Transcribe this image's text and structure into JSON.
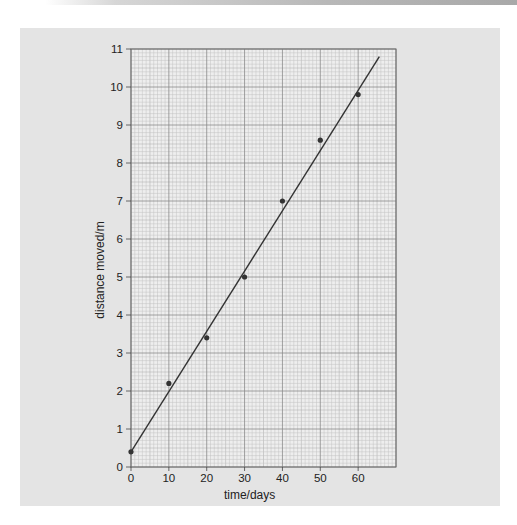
{
  "colors": {
    "panel_bg": "#e4e4e4",
    "grid_paper": "#eeeeee",
    "grid_minor": "#c2c2c2",
    "grid_major": "#8a8a8a",
    "line": "#333333",
    "points": "#333333"
  },
  "chart_data": {
    "type": "scatter",
    "title": "",
    "xlabel": "time/days",
    "ylabel": "distance moved/m",
    "xlim": [
      0,
      70
    ],
    "ylim": [
      0,
      11
    ],
    "x_ticks": [
      "0",
      "10",
      "20",
      "30",
      "40",
      "50",
      "60"
    ],
    "y_ticks": [
      "0",
      "1",
      "2",
      "3",
      "4",
      "5",
      "6",
      "7",
      "8",
      "9",
      "10",
      "11"
    ],
    "grid": true,
    "legend": null,
    "series": [
      {
        "name": "measurements",
        "x": [
          0,
          10,
          20,
          30,
          40,
          50,
          60
        ],
        "y": [
          0.4,
          2.2,
          3.4,
          5.0,
          7.0,
          8.6,
          9.8
        ]
      }
    ],
    "best_fit_line": {
      "x": [
        0,
        65.6
      ],
      "y": [
        0.4,
        10.8
      ]
    }
  }
}
